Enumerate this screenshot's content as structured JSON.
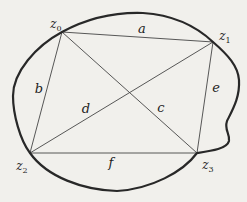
{
  "figure": {
    "type": "geometry-diagram",
    "background": "#f1f0ec",
    "curve_color": "#282828",
    "chord_color": "#454545",
    "label_color": "#1e1e1e",
    "vertices": [
      {
        "name": "z0",
        "base": "z",
        "sub": "0"
      },
      {
        "name": "z1",
        "base": "z",
        "sub": "1"
      },
      {
        "name": "z2",
        "base": "z",
        "sub": "2"
      },
      {
        "name": "z3",
        "base": "z",
        "sub": "3"
      }
    ],
    "edges": [
      {
        "name": "a",
        "label": "a",
        "from": "z0",
        "to": "z1",
        "kind": "side"
      },
      {
        "name": "b",
        "label": "b",
        "from": "z0",
        "to": "z2",
        "kind": "side"
      },
      {
        "name": "c",
        "label": "c",
        "from": "z0",
        "to": "z3",
        "kind": "diagonal"
      },
      {
        "name": "d",
        "label": "d",
        "from": "z2",
        "to": "z1",
        "kind": "diagonal"
      },
      {
        "name": "e",
        "label": "e",
        "from": "z1",
        "to": "z3",
        "kind": "side"
      },
      {
        "name": "f",
        "label": "f",
        "from": "z2",
        "to": "z3",
        "kind": "side"
      }
    ]
  }
}
